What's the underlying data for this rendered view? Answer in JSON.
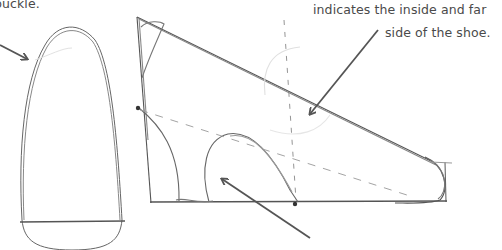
{
  "annotations": {
    "buckle_label": "buckle.",
    "inside_far_line1": "indicates the inside and far",
    "inside_far_line2": "side of the shoe."
  },
  "colors": {
    "stroke": "#555555",
    "faint": "#b5b5b5",
    "text": "#4a4a4a",
    "background": "#ffffff"
  },
  "figures": [
    {
      "name": "sole-top-view",
      "description": "Elongated rounded sole outline seen from above"
    },
    {
      "name": "shoe-side-view",
      "description": "Side-view wedge shoe sketch with heel arch, dashed guide lines and dots"
    }
  ]
}
